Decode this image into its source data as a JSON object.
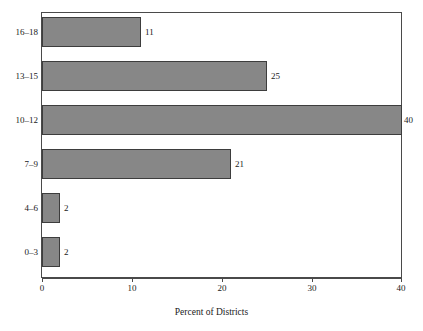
{
  "chart_data": {
    "type": "bar",
    "orientation": "horizontal",
    "title": "",
    "xlabel": "Percent of Districts",
    "ylabel": "",
    "categories": [
      "0–3",
      "4–6",
      "7–9",
      "10–12",
      "13–15",
      "16–18"
    ],
    "values": [
      2,
      2,
      21,
      40,
      25,
      11
    ],
    "data_labels": [
      "2",
      "2",
      "21",
      "40",
      "25",
      "11"
    ],
    "xlim": [
      0,
      40
    ],
    "xticks": [
      0,
      10,
      20,
      30,
      40
    ],
    "xtick_labels": [
      "0",
      "10",
      "20",
      "30",
      "40"
    ],
    "grid": false,
    "legend": false,
    "series": [
      {
        "name": "Percent of Districts",
        "values": [
          2,
          2,
          21,
          40,
          25,
          11
        ]
      }
    ],
    "colors": {
      "bar_fill": "#878787",
      "bar_edge": "#3d3d3d",
      "axis": "#4a4a4a",
      "text": "#1a1a1a",
      "background": "#ffffff"
    }
  },
  "axis": {
    "x_title": "Percent of Districts",
    "ticks": [
      {
        "label": "0",
        "value": 0
      },
      {
        "label": "10",
        "value": 10
      },
      {
        "label": "20",
        "value": 20
      },
      {
        "label": "30",
        "value": 30
      },
      {
        "label": "40",
        "value": 40
      }
    ]
  },
  "bars": [
    {
      "category": "16–18",
      "value": 11,
      "label": "11"
    },
    {
      "category": "13–15",
      "value": 25,
      "label": "25"
    },
    {
      "category": "10–12",
      "value": 40,
      "label": "40"
    },
    {
      "category": "7–9",
      "value": 21,
      "label": "21"
    },
    {
      "category": "4–6",
      "value": 2,
      "label": "2"
    },
    {
      "category": "0–3",
      "value": 2,
      "label": "2"
    }
  ]
}
